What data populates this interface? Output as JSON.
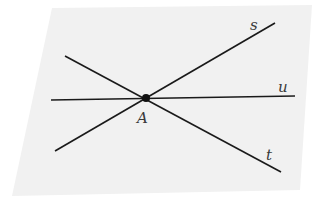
{
  "diagram": {
    "plane": {
      "points": [
        [
          52,
          8
        ],
        [
          312,
          5
        ],
        [
          300,
          190
        ],
        [
          12,
          196
        ]
      ],
      "fill": "#f1f1f1"
    },
    "point": {
      "label": "A",
      "x": 146,
      "y": 98
    },
    "lines": [
      {
        "name": "s",
        "label": "s",
        "x1": 55,
        "y1": 151,
        "x2": 275,
        "y2": 23,
        "lx": 250,
        "ly": 30
      },
      {
        "name": "t",
        "label": "t",
        "x1": 65,
        "y1": 56,
        "x2": 281,
        "y2": 172,
        "lx": 266,
        "ly": 158
      },
      {
        "name": "u",
        "label": "u",
        "x1": 51,
        "y1": 100,
        "x2": 295,
        "y2": 96,
        "lx": 278,
        "ly": 91
      }
    ],
    "line_color": "#1a1a1a"
  }
}
